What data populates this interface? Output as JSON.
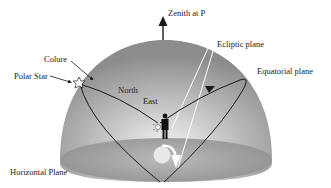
{
  "diagram": {
    "labels": {
      "zenith": "Zenith at P",
      "ecliptic": "Ecliptic plane",
      "equatorial": "Equatorial plane",
      "colure": "Colure",
      "polar_star": "Polar Star",
      "north": "North",
      "east": "East",
      "horizontal": "Horizontal Plane"
    },
    "colors": {
      "dome_light": "#e6e6e6",
      "dome_mid": "#a8a8a8",
      "dome_dark": "#8a8a8a",
      "floor": "#9a9a9a",
      "line": "#1a1a1a"
    }
  }
}
